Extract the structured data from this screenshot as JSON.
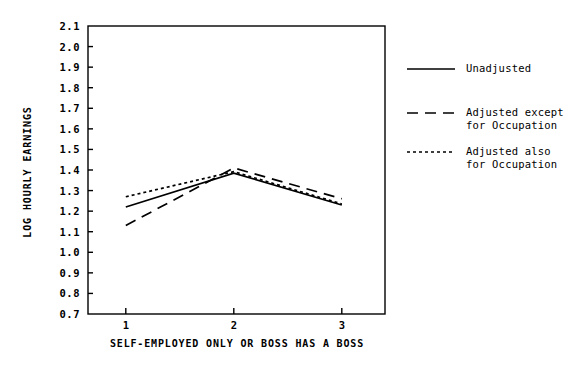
{
  "chart_data": {
    "type": "line",
    "title": "",
    "xlabel": "SELF-EMPLOYED ONLY OR BOSS HAS A BOSS",
    "ylabel": "LOG HOURLY EARNINGS",
    "x": [
      1,
      2,
      3
    ],
    "xticklabels": [
      "1",
      "2",
      "3"
    ],
    "xlim": [
      0.65,
      3.4
    ],
    "ylim": [
      0.7,
      2.1
    ],
    "yticks": [
      0.7,
      0.8,
      0.9,
      1.0,
      1.1,
      1.2,
      1.3,
      1.4,
      1.5,
      1.6,
      1.7,
      1.8,
      1.9,
      2.0,
      2.1
    ],
    "yticklabels": [
      "0.7",
      "0.8",
      "0.9",
      "1.0",
      "1.1",
      "1.2",
      "1.3",
      "1.4",
      "1.5",
      "1.6",
      "1.7",
      "1.8",
      "1.9",
      "2.0",
      "2.1"
    ],
    "grid": false,
    "legend_position": "right",
    "series": [
      {
        "name": "Unadjusted",
        "style": "solid",
        "color": "#000000",
        "values": [
          1.22,
          1.385,
          1.23
        ]
      },
      {
        "name": "Adjusted except\nfor Occupation",
        "style": "dashed",
        "color": "#000000",
        "values": [
          1.13,
          1.41,
          1.26
        ]
      },
      {
        "name": "Adjusted also\nfor Occupation",
        "style": "dotted",
        "color": "#000000",
        "values": [
          1.27,
          1.392,
          1.235
        ]
      }
    ]
  },
  "legend": {
    "entries": [
      {
        "label_line1": "Unadjusted",
        "label_line2": ""
      },
      {
        "label_line1": "Adjusted except",
        "label_line2": "for Occupation"
      },
      {
        "label_line1": "Adjusted also",
        "label_line2": "for Occupation"
      }
    ]
  }
}
